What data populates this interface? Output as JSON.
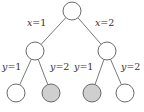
{
  "diagram": {
    "colors": {
      "node_fill": "#ffffff",
      "highlight_fill": "#cfcfcf",
      "stroke": "#5a5a5a",
      "edge": "#6a6a6a"
    },
    "nodes": [
      {
        "id": "root",
        "cx": 72,
        "cy": 11,
        "r": 9,
        "highlighted": false
      },
      {
        "id": "x1",
        "cx": 35,
        "cy": 51,
        "r": 9,
        "highlighted": false
      },
      {
        "id": "x2",
        "cx": 107,
        "cy": 51,
        "r": 9,
        "highlighted": false
      },
      {
        "id": "x1y1",
        "cx": 16,
        "cy": 93,
        "r": 9,
        "highlighted": false
      },
      {
        "id": "x1y2",
        "cx": 51,
        "cy": 93,
        "r": 9,
        "highlighted": true
      },
      {
        "id": "x2y1",
        "cx": 92,
        "cy": 93,
        "r": 9,
        "highlighted": true
      },
      {
        "id": "x2y2",
        "cx": 125,
        "cy": 93,
        "r": 9,
        "highlighted": false
      }
    ],
    "edges": [
      {
        "from": "root",
        "to": "x1"
      },
      {
        "from": "root",
        "to": "x2"
      },
      {
        "from": "x1",
        "to": "x1y1"
      },
      {
        "from": "x1",
        "to": "x1y2"
      },
      {
        "from": "x2",
        "to": "x2y1"
      },
      {
        "from": "x2",
        "to": "x2y2"
      }
    ],
    "edge_labels": [
      {
        "var": "x",
        "text": "=1",
        "left": 27,
        "top": 18
      },
      {
        "var": "x",
        "text": "=2",
        "left": 95,
        "top": 18
      },
      {
        "var": "y",
        "text": "=1",
        "left": 2,
        "top": 62
      },
      {
        "var": "y",
        "text": "=2",
        "left": 50,
        "top": 62
      },
      {
        "var": "y",
        "text": "=1",
        "left": 74,
        "top": 62
      },
      {
        "var": "y",
        "text": "=2",
        "left": 121,
        "top": 62
      }
    ]
  }
}
